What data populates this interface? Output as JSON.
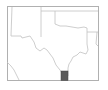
{
  "map": {
    "title": "Texas locator map",
    "region": "Texas and surrounding states",
    "highlighted_area": "South Texas county (Rio Grande Valley)",
    "colors": {
      "background": "#ffffff",
      "border": "#b0b0b0",
      "state_lines": "#bdbdbd",
      "highlight_fill": "#5a5a5a",
      "highlight_stroke": "#444444"
    }
  }
}
